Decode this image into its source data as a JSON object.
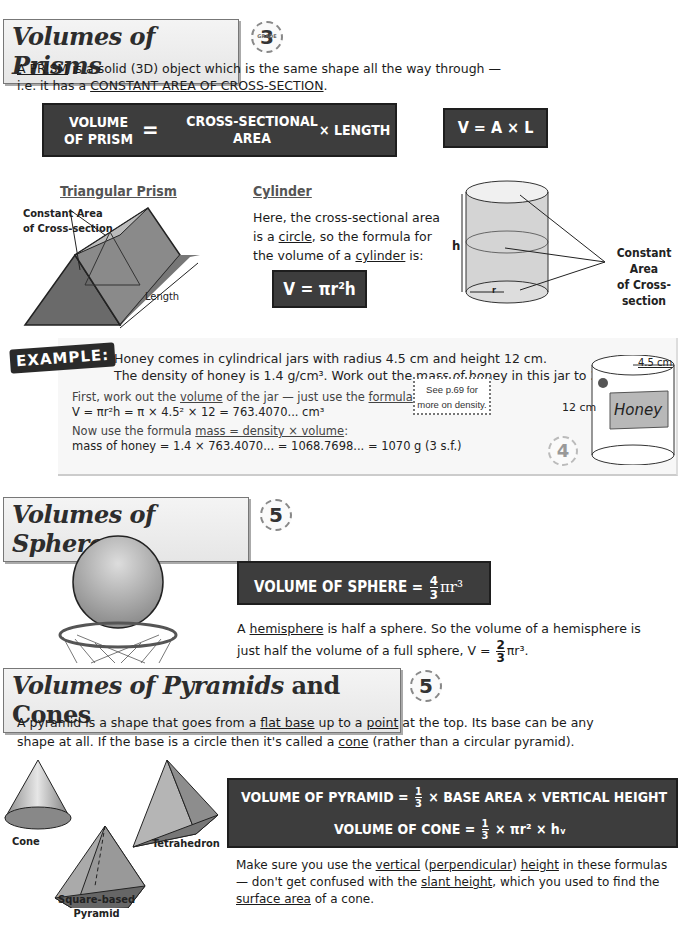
{
  "prisms": {
    "title": "Volumes of Prisms",
    "grade": "3",
    "grade_label": "GRADE",
    "intro_term": "A PRISM",
    "intro_line1": " is a solid (3D) object which is the same shape all the way through —",
    "intro_line2_pre": "i.e. it has a ",
    "intro_line2_term": "CONSTANT AREA OF CROSS-SECTION",
    "intro_line2_post": ".",
    "formula_box": {
      "lhs_line1": "VOLUME",
      "lhs_line2": "OF PRISM",
      "equals": "=",
      "mid_line1": "CROSS-SECTIONAL",
      "mid_line2": "AREA",
      "rhs": "× LENGTH"
    },
    "short_formula": "V = A × L",
    "triangular": {
      "heading": "Triangular Prism",
      "label_cross_1": "Constant Area",
      "label_cross_2": "of Cross-section",
      "label_length": "Length"
    },
    "cylinder": {
      "heading": "Cylinder",
      "text_l1": "Here, the cross-sectional area",
      "text_l2_pre": "is a ",
      "text_l2_term": "circle",
      "text_l2_post": ", so the formula for",
      "text_l3_pre": "the volume of a ",
      "text_l3_term": "cylinder",
      "text_l3_post": " is:",
      "formula": "V = πr²h",
      "label_h": "h",
      "label_r": "r",
      "label_cross_1": "Constant Area",
      "label_cross_2": "of Cross-section"
    }
  },
  "example": {
    "badge": "EXAMPLE:",
    "question_l1": "Honey comes in cylindrical jars with radius 4.5 cm and height 12 cm.",
    "question_l2": "The density of honey is 1.4 g/cm³.  Work out the mass of honey in this jar to 3 s.f.",
    "step1_pre": "First, work out the ",
    "step1_term1": "volume",
    "step1_mid": " of the jar — just use the ",
    "step1_term2": "formula",
    "step1_post": " above:",
    "step1_calc": "V = πr²h = π × 4.5² × 12 = 763.4070... cm³",
    "step2_pre": "Now use the formula ",
    "step2_term": "mass = density × volume",
    "step2_post": ":",
    "step2_calc": "mass of honey = 1.4 × 763.4070... = 1068.7698... = 1070 g (3 s.f.)",
    "note_l1": "See p.69 for",
    "note_l2": "more on density.",
    "grade": "4",
    "jar_radius": "4.5 cm",
    "jar_height": "12 cm",
    "jar_label": "Honey"
  },
  "spheres": {
    "title": "Volumes of Spheres",
    "grade": "5",
    "formula_lhs": "VOLUME OF SPHERE =",
    "formula_num": "4",
    "formula_den": "3",
    "formula_rest": "πr³",
    "text_l1_pre": "A ",
    "text_l1_term": "hemisphere",
    "text_l1_post": " is half a sphere.  So the volume of a hemisphere is",
    "text_l2": "just half the volume of a full sphere, V =",
    "text_l2_num": "2",
    "text_l2_den": "3",
    "text_l2_rest": "πr³."
  },
  "pyramids": {
    "title_italic": "Volumes of Pyramids",
    "title_rest": " and Cones",
    "grade": "5",
    "intro_l1_pre": "A pyramid is a shape that goes from a ",
    "intro_l1_term1": "flat base",
    "intro_l1_mid": " up to a ",
    "intro_l1_term2": "point",
    "intro_l1_post": " at the top.  Its base can be any",
    "intro_l2_pre": "shape at all.  If the base is a circle then it's called a ",
    "intro_l2_term": "cone",
    "intro_l2_post": " (rather than a circular pyramid).",
    "formula1_lhs": "VOLUME OF PYRAMID =",
    "formula1_num": "1",
    "formula1_den": "3",
    "formula1_rest": "× BASE AREA × VERTICAL HEIGHT",
    "formula2_lhs": "VOLUME OF CONE =",
    "formula2_num": "1",
    "formula2_den": "3",
    "formula2_rest": "× πr² × hᵥ",
    "shape_labels": {
      "cone": "Cone",
      "tetrahedron": "Tetrahedron",
      "square_1": "Square-based",
      "square_2": "Pyramid"
    },
    "tip_l1_pre": "Make sure you use the ",
    "tip_l1_t1": "vertical",
    "tip_l1_s1": " (",
    "tip_l1_t2": "perpendicular",
    "tip_l1_s2": ") ",
    "tip_l1_t3": "height",
    "tip_l1_post": " in these formulas",
    "tip_l2_pre": "— don't get confused with the ",
    "tip_l2_term": "slant height",
    "tip_l2_post": ", which you used to find the",
    "tip_l3_term": "surface area",
    "tip_l3_post": " of a cone."
  }
}
